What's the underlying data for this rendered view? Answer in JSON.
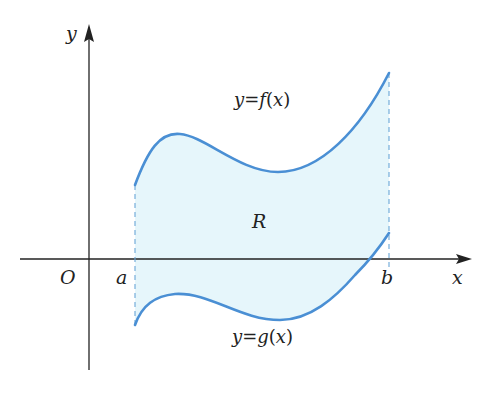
{
  "diagram": {
    "type": "region-between-curves",
    "axes": {
      "x_label": "x",
      "y_label": "y",
      "origin_label": "O"
    },
    "bounds": {
      "left_label": "a",
      "right_label": "b"
    },
    "curves": [
      {
        "name": "upper",
        "label": "y=f(x)",
        "label_parts": [
          "y",
          "=",
          "f",
          "(",
          "x",
          ")"
        ]
      },
      {
        "name": "lower",
        "label": "y=g(x)",
        "label_parts": [
          "y",
          "=",
          "g",
          "(",
          "x",
          ")"
        ]
      }
    ],
    "region_label": "R",
    "colors": {
      "curve": "#4a8fd4",
      "fill": "#e6f6fb",
      "axis": "#222222",
      "dash": "#6aa6d8"
    }
  }
}
